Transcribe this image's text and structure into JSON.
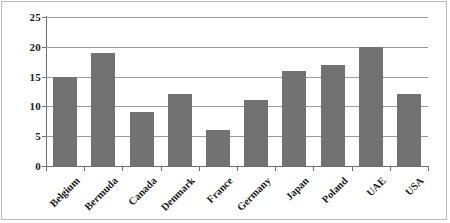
{
  "chart_data": {
    "type": "bar",
    "title": "",
    "subtitle": "",
    "xlabel": "",
    "ylabel": "",
    "categories": [
      "Belgium",
      "Bermuda",
      "Canada",
      "Denmark",
      "France",
      "Germany",
      "Japan",
      "Poland",
      "UAE",
      "USA"
    ],
    "values": [
      15,
      19,
      9,
      12,
      6,
      11,
      16,
      17,
      20,
      12
    ],
    "ylim": [
      0,
      25
    ],
    "yticks": [
      0,
      5,
      10,
      15,
      20,
      25
    ],
    "ytick_labels": [
      "0",
      "5",
      "10",
      "15",
      "20",
      "25"
    ],
    "grid": true,
    "grid_axis": "y",
    "legend": false,
    "legend_position": "none",
    "bar_color": "#727272",
    "gridline_color": "#9a9a9a",
    "axis_color": "#6f6f6f",
    "background_color": "#ffffff",
    "xtick_label_rotation": -45
  }
}
